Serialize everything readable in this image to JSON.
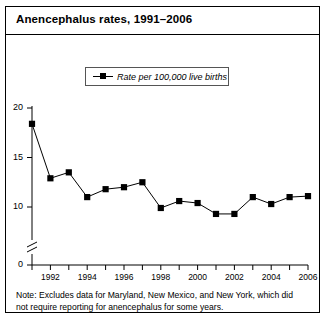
{
  "figure": {
    "title": "Anencephalus rates, 1991–2006",
    "note": "Note: Excludes data for Maryland, New Mexico, and New York, which did not require reporting for anencephalus for some years."
  },
  "legend": {
    "entries": [
      {
        "label": "Rate per 100,000 live births",
        "marker": "square",
        "color": "#000000"
      }
    ]
  },
  "chart_data": {
    "type": "line",
    "title": "Anencephalus rates, 1991–2006",
    "xlabel": "",
    "ylabel": "",
    "ylim": [
      0,
      20
    ],
    "yticks": [
      0,
      10,
      15,
      20
    ],
    "ytick_labels": [
      "0",
      "10",
      "15",
      "20"
    ],
    "y_axis_break": true,
    "y_break_between": [
      0,
      9
    ],
    "grid": false,
    "legend_position": "top-center",
    "xlim": [
      1991,
      2006
    ],
    "x": [
      1991,
      1992,
      1993,
      1994,
      1995,
      1996,
      1997,
      1998,
      1999,
      2000,
      2001,
      2002,
      2003,
      2004,
      2005,
      2006
    ],
    "xticks": [
      1991,
      1992,
      1993,
      1994,
      1995,
      1996,
      1997,
      1998,
      1999,
      2000,
      2001,
      2002,
      2003,
      2004,
      2005,
      2006
    ],
    "xtick_labels": [
      "",
      "1992",
      "",
      "1994",
      "",
      "1996",
      "",
      "1998",
      "",
      "2000",
      "",
      "2002",
      "",
      "2004",
      "",
      "2006"
    ],
    "series": [
      {
        "name": "Rate per 100,000 live births",
        "color": "#000000",
        "marker": "square",
        "values": [
          18.4,
          12.9,
          13.5,
          11.0,
          11.8,
          12.0,
          12.5,
          9.9,
          10.6,
          10.4,
          9.3,
          9.3,
          11.0,
          10.3,
          11.0,
          11.1
        ]
      }
    ]
  }
}
